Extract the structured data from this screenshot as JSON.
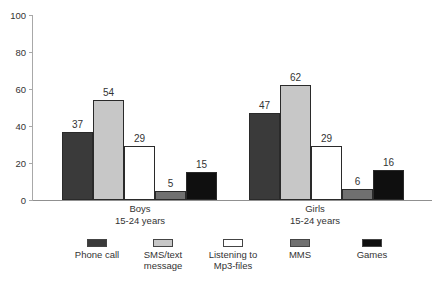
{
  "chart_data": {
    "type": "bar",
    "title": "",
    "xlabel": "",
    "ylabel": "",
    "ylim": [
      0,
      100
    ],
    "yticks": [
      0,
      20,
      40,
      60,
      80,
      100
    ],
    "grid": false,
    "legend_position": "bottom",
    "categories": [
      {
        "line1": "Boys",
        "line2": "15-24 years"
      },
      {
        "line1": "Girls",
        "line2": "15-24 years"
      }
    ],
    "series": [
      {
        "name": "Phone call",
        "legend_lines": [
          "Phone call"
        ],
        "color": "#3a3a3a",
        "values": [
          37,
          47
        ]
      },
      {
        "name": "SMS/text message",
        "legend_lines": [
          "SMS/text",
          "message"
        ],
        "color": "#c7c7c7",
        "values": [
          54,
          62
        ]
      },
      {
        "name": "Listening to Mp3-files",
        "legend_lines": [
          "Listening to",
          "Mp3-files"
        ],
        "color": "#ffffff",
        "values": [
          29,
          29
        ]
      },
      {
        "name": "MMS",
        "legend_lines": [
          "MMS"
        ],
        "color": "#707070",
        "values": [
          5,
          6
        ]
      },
      {
        "name": "Games",
        "legend_lines": [
          "Games"
        ],
        "color": "#0f0f0f",
        "values": [
          15,
          16
        ]
      }
    ]
  },
  "colors": {
    "text": "#333333",
    "y_axis": "#a8a8a8",
    "baseline": "#909090",
    "bar_border": "#2a2a2a"
  }
}
